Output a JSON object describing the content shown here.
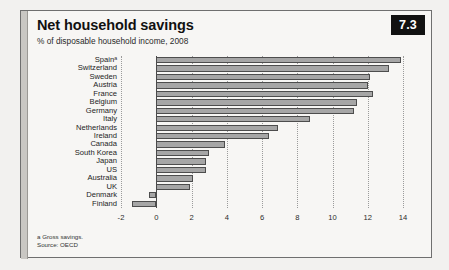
{
  "figure": {
    "badge": "7.3",
    "title": "Net household savings",
    "subtitle": "% of disposable household income, 2008",
    "footnote_a": "a Gross savings.",
    "footnote_source": "Source: OECD",
    "accent_color": "#111111",
    "bar_fill": "#a6a6a6",
    "bar_stroke": "#4d4d4d",
    "card_bg": "#f7f6f4",
    "page_bg": "#f2f1ef"
  },
  "chart_data": {
    "type": "bar",
    "orientation": "horizontal",
    "title": "Net household savings",
    "subtitle": "% of disposable household income, 2008",
    "xlabel": "",
    "ylabel": "",
    "xlim": [
      -2,
      14
    ],
    "xticks": [
      -2,
      0,
      2,
      4,
      6,
      8,
      10,
      12,
      14
    ],
    "xtick_labels": [
      "-2",
      "0",
      "2",
      "4",
      "6",
      "8",
      "10",
      "12",
      "14"
    ],
    "grid": true,
    "grid_axis": "x",
    "legend": false,
    "categories": [
      "Spainᵃ",
      "Switzerland",
      "Sweden",
      "Austria",
      "France",
      "Belgium",
      "Germany",
      "Italy",
      "Netherlands",
      "Ireland",
      "Canada",
      "South Korea",
      "Japan",
      "US",
      "Australia",
      "UK",
      "Denmark",
      "Finland"
    ],
    "values": [
      13.9,
      13.2,
      12.1,
      12.0,
      12.3,
      11.4,
      11.2,
      8.7,
      6.9,
      6.4,
      3.9,
      3.0,
      2.8,
      2.8,
      2.1,
      1.9,
      -0.4,
      -1.4
    ],
    "values_labels": [
      "13.9",
      "13.2",
      "12.1",
      "12.0",
      "12.3",
      "11.4",
      "11.2",
      "8.7",
      "6.9",
      "6.4",
      "3.9",
      "3.0",
      "2.8",
      "2.8",
      "2.1",
      "1.9",
      "-0.4",
      "-1.4"
    ],
    "note": "a Gross savings.",
    "source": "Source: OECD"
  }
}
